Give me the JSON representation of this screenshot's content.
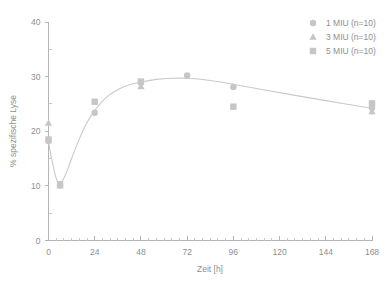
{
  "chart_data": {
    "type": "scatter",
    "title": "",
    "xlabel": "Zeit [h]",
    "ylabel": "% spezifische Lyse",
    "xlim": [
      0,
      168
    ],
    "ylim": [
      0,
      40
    ],
    "xticks": [
      0,
      24,
      48,
      72,
      96,
      120,
      144,
      168
    ],
    "yticks": [
      0,
      10,
      20,
      30,
      40
    ],
    "x_minor_step": 4,
    "y_minor_step": 5,
    "grid": false,
    "legend_position": "top-right",
    "series": [
      {
        "name": "1 MIU (n=10)",
        "marker": "circle",
        "color": "#c6c6c6",
        "x": [
          0,
          6,
          24,
          48,
          72,
          96,
          168
        ],
        "values": [
          18.2,
          10.1,
          23.4,
          28.9,
          30.2,
          28.1,
          24.3
        ]
      },
      {
        "name": "3 MIU (n=10)",
        "marker": "triangle",
        "color": "#c6c6c6",
        "x": [
          0,
          6,
          48,
          168
        ],
        "values": [
          21.5,
          10.0,
          28.2,
          23.6
        ]
      },
      {
        "name": "5 MIU (n=10)",
        "marker": "square",
        "color": "#c6c6c6",
        "x": [
          0,
          6,
          24,
          48,
          96,
          168
        ],
        "values": [
          18.5,
          10.3,
          25.4,
          29.1,
          24.5,
          25.1
        ]
      }
    ],
    "fit_curve": {
      "label": "trend",
      "color": "#c9c9c9",
      "x": [
        0,
        2,
        4,
        6,
        9,
        12,
        16,
        20,
        24,
        30,
        36,
        42,
        48,
        56,
        64,
        72,
        84,
        96,
        110,
        126,
        144,
        168
      ],
      "y": [
        18.0,
        14.3,
        11.4,
        10.3,
        12.2,
        15.0,
        18.6,
        21.6,
        23.8,
        26.2,
        27.6,
        28.5,
        29.0,
        29.5,
        29.7,
        29.7,
        29.3,
        28.6,
        27.7,
        26.7,
        25.6,
        24.2
      ]
    },
    "error_bars": [
      {
        "x": 168,
        "low": 23.0,
        "high": 25.6
      },
      {
        "x": 48,
        "low": 27.9,
        "high": 29.5
      }
    ]
  },
  "legend": {
    "entries": [
      {
        "label": "1 MIU (n=10)",
        "marker": "circle"
      },
      {
        "label": "3 MIU (n=10)",
        "marker": "triangle"
      },
      {
        "label": "5 MIU (n=10)",
        "marker": "square"
      }
    ]
  },
  "axes": {
    "x_tick_labels": [
      "0",
      "24",
      "48",
      "72",
      "96",
      "120",
      "144",
      "168"
    ],
    "y_tick_labels": [
      "0",
      "10",
      "20",
      "30",
      "40"
    ],
    "x_title": "Zeit [h]",
    "y_title": "% spezifische Lyse"
  }
}
